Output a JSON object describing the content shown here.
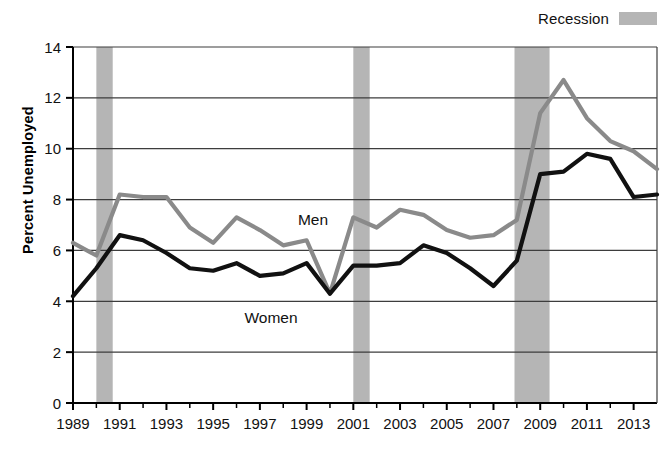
{
  "legend": {
    "label": "Recession",
    "swatch_color": "#b5b5b5",
    "position": "top-right"
  },
  "axis": {
    "ylabel": "Percent Unemployed",
    "xlabel": "",
    "yticks": [
      "0",
      "2",
      "4",
      "6",
      "8",
      "10",
      "12",
      "14"
    ],
    "xticks": [
      "1989",
      "1991",
      "1993",
      "1995",
      "1997",
      "1999",
      "2001",
      "2003",
      "2005",
      "2007",
      "2009",
      "2011",
      "2013"
    ]
  },
  "annotations": {
    "men_label": "Men",
    "women_label": "Women"
  },
  "colors": {
    "men_line": "#8a8a8a",
    "women_line": "#111111",
    "recession_band": "#b5b5b5",
    "gridline": "#3d3d3d",
    "axis": "#000000",
    "background": "#ffffff"
  },
  "chart_data": {
    "type": "line",
    "title": "",
    "xlabel": "",
    "ylabel": "Percent Unemployed",
    "xlim": [
      1989,
      2014
    ],
    "ylim": [
      0,
      14
    ],
    "grid": true,
    "legend_position": "top-right",
    "x": [
      1989,
      1990,
      1991,
      1992,
      1993,
      1994,
      1995,
      1996,
      1997,
      1998,
      1999,
      2000,
      2001,
      2002,
      2003,
      2004,
      2005,
      2006,
      2007,
      2008,
      2009,
      2010,
      2011,
      2012,
      2013,
      2014
    ],
    "series": [
      {
        "name": "Men",
        "color": "#8a8a8a",
        "values": [
          6.3,
          5.8,
          8.2,
          8.1,
          8.1,
          6.9,
          6.3,
          7.3,
          6.8,
          6.2,
          6.4,
          4.3,
          7.3,
          6.9,
          7.6,
          7.4,
          6.8,
          6.5,
          6.6,
          7.2,
          11.4,
          12.7,
          11.2,
          10.3,
          9.9,
          9.2
        ]
      },
      {
        "name": "Women",
        "color": "#111111",
        "values": [
          4.2,
          5.3,
          6.6,
          6.4,
          5.9,
          5.3,
          5.2,
          5.5,
          5.0,
          5.1,
          5.5,
          4.3,
          5.4,
          5.4,
          5.5,
          6.2,
          5.9,
          5.3,
          4.6,
          5.6,
          9.0,
          9.1,
          9.8,
          9.6,
          8.1,
          8.2
        ]
      }
    ],
    "recession_bands": [
      {
        "start": 1990.0,
        "end": 1990.7
      },
      {
        "start": 2001.0,
        "end": 2001.7
      },
      {
        "start": 2007.9,
        "end": 2009.4
      }
    ]
  }
}
